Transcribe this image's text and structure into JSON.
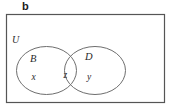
{
  "figure": {
    "panel_label": "b",
    "type": "venn-diagram",
    "universe": {
      "label": "U",
      "shape": "rectangle"
    },
    "sets": [
      {
        "id": "B",
        "label": "B",
        "shape": "ellipse",
        "position": "left"
      },
      {
        "id": "D",
        "label": "D",
        "shape": "ellipse",
        "position": "right"
      }
    ],
    "elements": [
      {
        "label": "x",
        "region": "B-only"
      },
      {
        "label": "z",
        "region": "B-and-D-intersection"
      },
      {
        "label": "y",
        "region": "D-only"
      }
    ],
    "colors": {
      "rectangle_stroke": "#555555",
      "ellipse_stroke": "#6e6e6e",
      "text": "#2a2a2a",
      "panel_label": "#1a1a1a",
      "background": "#ffffff"
    }
  }
}
